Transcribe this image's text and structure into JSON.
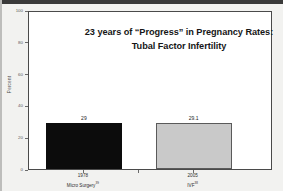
{
  "chart_data": {
    "type": "bar",
    "title": "23 years of “Progress” in Pregnancy Rates:",
    "subtitle": "Tubal Factor Infertility",
    "xlabel": "",
    "ylabel": "Percent",
    "ylim": [
      0,
      100
    ],
    "yticks": [
      0,
      20,
      40,
      60,
      80,
      100
    ],
    "ytick_labels": [
      "0",
      "20",
      "40",
      "60",
      "80",
      "100"
    ],
    "grid": false,
    "legend": false,
    "categories": [
      "1978",
      "2005"
    ],
    "values": [
      29,
      29.1
    ],
    "value_labels": [
      "29",
      "29.1"
    ],
    "bars": [
      {
        "year": "1978",
        "method": "Micro Surgery",
        "citation": "39",
        "value": 29,
        "value_label": "29",
        "fill": "#0c0c0c",
        "border": "#0c0c0c"
      },
      {
        "year": "2005",
        "method": "IVF",
        "citation": "38",
        "value": 29.1,
        "value_label": "29.1",
        "fill": "#c9c9c9",
        "border": "#5a5a5a"
      }
    ]
  },
  "colors": {
    "slide_background": "#f2f2f0",
    "plot_background": "#ffffff",
    "frame": "#4a4a4a",
    "axis_text": "#5a5a5a",
    "title_text": "#161616",
    "bar_dark": "#0c0c0c",
    "bar_light": "#c9c9c9"
  }
}
